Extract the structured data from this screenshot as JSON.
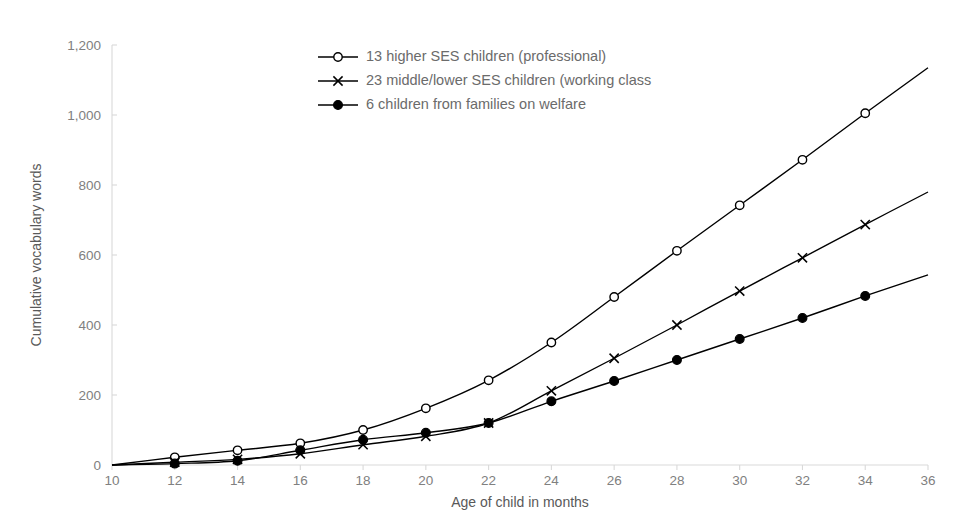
{
  "chart_data": {
    "type": "line",
    "title": "",
    "xlabel": "Age of child in months",
    "ylabel": "Cumulative vocabulary words",
    "x": [
      10,
      12,
      14,
      16,
      18,
      20,
      22,
      24,
      26,
      28,
      30,
      32,
      34,
      36
    ],
    "xlim": [
      10,
      36
    ],
    "ylim": [
      0,
      1200
    ],
    "xticks": [
      "10",
      "12",
      "14",
      "16",
      "18",
      "20",
      "22",
      "24",
      "26",
      "28",
      "30",
      "32",
      "34",
      "36"
    ],
    "yticks": [
      "0",
      "200",
      "400",
      "600",
      "800",
      "1,000",
      "1,200"
    ],
    "grid": false,
    "legend_position": "top-center",
    "series": [
      {
        "name": "13 higher SES children (professional)",
        "marker": "open-circle",
        "color": "#000000",
        "values": [
          0,
          22,
          42,
          62,
          100,
          162,
          242,
          350,
          480,
          612,
          742,
          872,
          1005,
          1135
        ]
      },
      {
        "name": "23 middle/lower SES children (working class",
        "marker": "cross",
        "color": "#000000",
        "values": [
          0,
          8,
          16,
          32,
          58,
          82,
          120,
          212,
          305,
          400,
          497,
          592,
          687,
          780
        ]
      },
      {
        "name": "6 children from families on welfare",
        "marker": "filled-circle",
        "color": "#000000",
        "values": [
          0,
          4,
          12,
          42,
          72,
          92,
          120,
          182,
          240,
          300,
          360,
          420,
          483,
          543
        ]
      }
    ]
  },
  "legend": {
    "items": [
      {
        "label": "13 higher SES children (professional)",
        "marker": "open-circle"
      },
      {
        "label": "23 middle/lower SES children (working class",
        "marker": "cross"
      },
      {
        "label": "6 children from families on welfare",
        "marker": "filled-circle"
      }
    ]
  },
  "colors": {
    "line": "#000000",
    "axis": "#d9d9d9",
    "tick_text": "#808080",
    "axis_title": "#595959",
    "legend_text": "#6b6b6b",
    "background": "#ffffff"
  }
}
